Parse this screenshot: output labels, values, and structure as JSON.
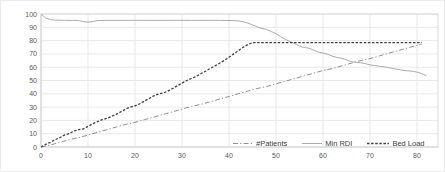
{
  "figure": {
    "background": "#ffffff",
    "outer_border_color": "#ececec",
    "plot_border_color": "#d9d9d9",
    "gridline_color": "#e8e8e8",
    "axis_line_color": "#d0d0d0",
    "tick_label_color": "#595959",
    "legend_text_color": "#404040"
  },
  "chart_data": {
    "type": "line",
    "title": "",
    "xlabel": "",
    "ylabel": "",
    "xlim": [
      0,
      84.5
    ],
    "ylim": [
      0,
      100
    ],
    "xticks": [
      0,
      10,
      20,
      30,
      40,
      50,
      60,
      70,
      80
    ],
    "yticks": [
      0,
      10,
      20,
      30,
      40,
      50,
      60,
      70,
      80,
      90,
      100
    ],
    "grid": true,
    "legend_position": "bottom-inside",
    "series": [
      {
        "name": "#Patients",
        "color": "#8f8f8f",
        "dash": "5,2.2,1.2,2.2",
        "width": 1,
        "points": [
          [
            0,
            0
          ],
          [
            2,
            1.5
          ],
          [
            4,
            3.5
          ],
          [
            6,
            5.5
          ],
          [
            8,
            7
          ],
          [
            10,
            9
          ],
          [
            12,
            11
          ],
          [
            14,
            13
          ],
          [
            16,
            15
          ],
          [
            18,
            17
          ],
          [
            20,
            18.5
          ],
          [
            22,
            20.5
          ],
          [
            24,
            22.5
          ],
          [
            26,
            24.5
          ],
          [
            28,
            26.5
          ],
          [
            30,
            28.5
          ],
          [
            32,
            30.5
          ],
          [
            34,
            32
          ],
          [
            36,
            34
          ],
          [
            38,
            36
          ],
          [
            40,
            38
          ],
          [
            42,
            40
          ],
          [
            44,
            42
          ],
          [
            46,
            44
          ],
          [
            48,
            45.5
          ],
          [
            50,
            47.5
          ],
          [
            52,
            49.5
          ],
          [
            54,
            51.5
          ],
          [
            56,
            53.5
          ],
          [
            58,
            55.5
          ],
          [
            60,
            57.5
          ],
          [
            62,
            59
          ],
          [
            64,
            61
          ],
          [
            66,
            63
          ],
          [
            68,
            65
          ],
          [
            70,
            66.5
          ],
          [
            72,
            68.5
          ],
          [
            74,
            70.5
          ],
          [
            76,
            72.5
          ],
          [
            78,
            74.5
          ],
          [
            80,
            76.5
          ],
          [
            81,
            77.5
          ]
        ]
      },
      {
        "name": "Min RDI",
        "color": "#ababab",
        "dash": "",
        "width": 1,
        "points": [
          [
            0,
            100
          ],
          [
            0.5,
            98.5
          ],
          [
            1,
            97
          ],
          [
            2,
            95.8
          ],
          [
            3,
            95.4
          ],
          [
            5,
            95.3
          ],
          [
            7,
            95.2
          ],
          [
            8,
            95.1
          ],
          [
            9,
            94.2
          ],
          [
            10,
            93.9
          ],
          [
            11,
            94.3
          ],
          [
            12,
            95
          ],
          [
            14,
            95.2
          ],
          [
            17,
            95.2
          ],
          [
            20,
            95.3
          ],
          [
            23,
            95.2
          ],
          [
            26,
            95.2
          ],
          [
            29,
            95.3
          ],
          [
            32,
            95.2
          ],
          [
            35,
            95.3
          ],
          [
            38,
            95.2
          ],
          [
            40,
            95.1
          ],
          [
            42,
            94.8
          ],
          [
            43,
            94.2
          ],
          [
            44,
            93.2
          ],
          [
            45,
            91.8
          ],
          [
            46,
            90.3
          ],
          [
            47,
            89.2
          ],
          [
            48,
            88.4
          ],
          [
            49,
            86.8
          ],
          [
            50,
            85.2
          ],
          [
            51,
            82.9
          ],
          [
            52,
            80.9
          ],
          [
            53,
            79.3
          ],
          [
            54,
            77.7
          ],
          [
            55,
            75.9
          ],
          [
            56,
            74.9
          ],
          [
            57,
            74.3
          ],
          [
            58,
            72.9
          ],
          [
            59,
            71.3
          ],
          [
            60,
            70.7
          ],
          [
            61,
            69.7
          ],
          [
            62,
            68.3
          ],
          [
            63,
            67.3
          ],
          [
            64,
            66.7
          ],
          [
            65,
            65.5
          ],
          [
            66,
            64.3
          ],
          [
            67,
            63.7
          ],
          [
            68,
            63.4
          ],
          [
            69,
            62.7
          ],
          [
            70,
            61.7
          ],
          [
            71,
            61.3
          ],
          [
            72,
            60.7
          ],
          [
            73,
            60.3
          ],
          [
            74,
            59.7
          ],
          [
            75,
            58.9
          ],
          [
            76,
            58.3
          ],
          [
            77,
            57.7
          ],
          [
            78,
            57.3
          ],
          [
            79,
            56.9
          ],
          [
            80,
            56.3
          ],
          [
            81,
            55.1
          ],
          [
            82,
            53.6
          ]
        ]
      },
      {
        "name": "Bed Load",
        "color": "#404040",
        "dash": "2.5,1.6",
        "width": 1.3,
        "points": [
          [
            0,
            0
          ],
          [
            1,
            2
          ],
          [
            2,
            3.5
          ],
          [
            3,
            5.5
          ],
          [
            4,
            7
          ],
          [
            5,
            9
          ],
          [
            6,
            10
          ],
          [
            7,
            12
          ],
          [
            8,
            13
          ],
          [
            9,
            13.5
          ],
          [
            10,
            15.5
          ],
          [
            11,
            17.5
          ],
          [
            12,
            19
          ],
          [
            13,
            20.5
          ],
          [
            14,
            21.5
          ],
          [
            15,
            23
          ],
          [
            16,
            24.5
          ],
          [
            17,
            26.5
          ],
          [
            18,
            28.5
          ],
          [
            19,
            30
          ],
          [
            20,
            31
          ],
          [
            21,
            32.5
          ],
          [
            22,
            34.5
          ],
          [
            23,
            36.5
          ],
          [
            24,
            38.5
          ],
          [
            25,
            40
          ],
          [
            26,
            40.5
          ],
          [
            27,
            42
          ],
          [
            28,
            44
          ],
          [
            29,
            46
          ],
          [
            30,
            48
          ],
          [
            31,
            50
          ],
          [
            32,
            51.5
          ],
          [
            33,
            53
          ],
          [
            34,
            55
          ],
          [
            35,
            57
          ],
          [
            36,
            59
          ],
          [
            37,
            61
          ],
          [
            38,
            63
          ],
          [
            39,
            65
          ],
          [
            40,
            67.5
          ],
          [
            41,
            70
          ],
          [
            42,
            72.5
          ],
          [
            43,
            75
          ],
          [
            44,
            77
          ],
          [
            45,
            78.5
          ],
          [
            48,
            78.5
          ],
          [
            52,
            78.5
          ],
          [
            56,
            78.5
          ],
          [
            60,
            78.5
          ],
          [
            64,
            78.5
          ],
          [
            68,
            78.5
          ],
          [
            72,
            78.5
          ],
          [
            76,
            78.5
          ],
          [
            80,
            78.5
          ],
          [
            81,
            78.5
          ]
        ]
      }
    ]
  }
}
